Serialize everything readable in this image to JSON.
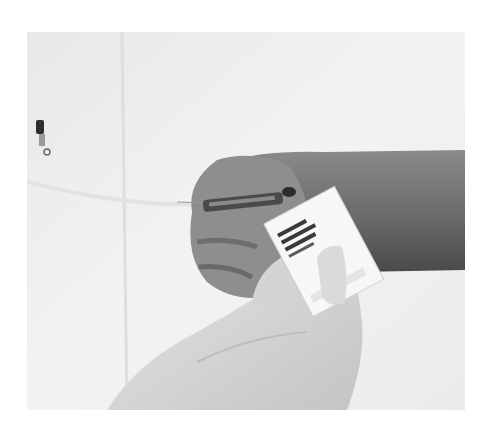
{
  "image": {
    "kind": "grayscale photograph",
    "subject": "gloved hand holding alcohol prep pad near injection site on back of hand with syringe",
    "colors": {
      "background": "#ffffff",
      "towel": "#f0f0f0",
      "towel_shadow": "#d8d8d8",
      "arm": "#7a7a7a",
      "arm_dark": "#555555",
      "hand": "#8e8e8e",
      "glove": "#dcdcdc",
      "glove_shadow": "#bdbdbd",
      "pad": "#f7f7f7",
      "pad_print": "#3a3a3a",
      "syringe": "#4a4a4a"
    },
    "objects": [
      {
        "name": "towel",
        "label": "white towel background"
      },
      {
        "name": "forearm",
        "label": "patient forearm"
      },
      {
        "name": "patient-hand",
        "label": "patient hand"
      },
      {
        "name": "syringe",
        "label": "syringe"
      },
      {
        "name": "gloved-hand",
        "label": "gloved hand"
      },
      {
        "name": "prep-pad",
        "label": "alcohol prep pad packet"
      },
      {
        "name": "vial",
        "label": "small vial"
      }
    ]
  }
}
